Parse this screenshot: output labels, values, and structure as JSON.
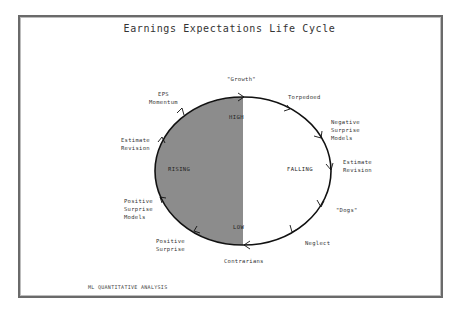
{
  "title": "Earnings Expectations Life Cycle",
  "footer": "ML QUANTITATIVE ANALYSIS",
  "colors": {
    "rising_fill": "#8c8c8c",
    "outline": "#111111",
    "frame": "#6a6a6a"
  },
  "cycle": {
    "shape": "ellipse",
    "direction": "clockwise",
    "halves": [
      {
        "label": "RISING",
        "fill": "gray"
      },
      {
        "label": "FALLING",
        "fill": "white"
      }
    ],
    "poles": {
      "top": "HIGH",
      "bottom": "LOW"
    }
  },
  "stages": [
    {
      "label": "\"Growth\""
    },
    {
      "label": "Torpedoed"
    },
    {
      "label": "Negative\nSurprise\nModels"
    },
    {
      "label": "Estimate\nRevision"
    },
    {
      "label": "\"Dogs\""
    },
    {
      "label": "Neglect"
    },
    {
      "label": "Contrarians"
    },
    {
      "label": "Positive\nSurprise"
    },
    {
      "label": "Positive\nSurprise\nModels"
    },
    {
      "label": "Estimate\nRevision"
    },
    {
      "label": "EPS\nMomentum"
    }
  ]
}
